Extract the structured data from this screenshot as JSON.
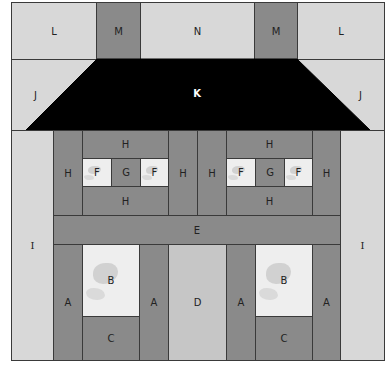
{
  "diagram": {
    "colors": {
      "light": "#d8d8d8",
      "medium": "#8a8a8a",
      "roof": "#000000",
      "window": "#eeeeee",
      "line": "#3a3a3a"
    },
    "pieces": {
      "L_left": "L",
      "M_left": "M",
      "N": "N",
      "M_right": "M",
      "L_right": "L",
      "J_left": "J",
      "K": "K",
      "J_right": "J",
      "I_left": "I",
      "I_right": "I",
      "H_left_outer": "H",
      "H_left_top": "H",
      "F_left_1": "F",
      "G_left": "G",
      "F_left_2": "F",
      "H_left_bottom": "H",
      "H_center_left": "H",
      "H_center_right": "H",
      "H_right_top": "H",
      "F_right_1": "F",
      "G_right": "G",
      "F_right_2": "F",
      "H_right_bottom": "H",
      "H_right_outer": "H",
      "E": "E",
      "A_1": "A",
      "B_left": "B",
      "C_left": "C",
      "A_2": "A",
      "D": "D",
      "A_3": "A",
      "B_right": "B",
      "C_right": "C",
      "A_4": "A"
    }
  }
}
